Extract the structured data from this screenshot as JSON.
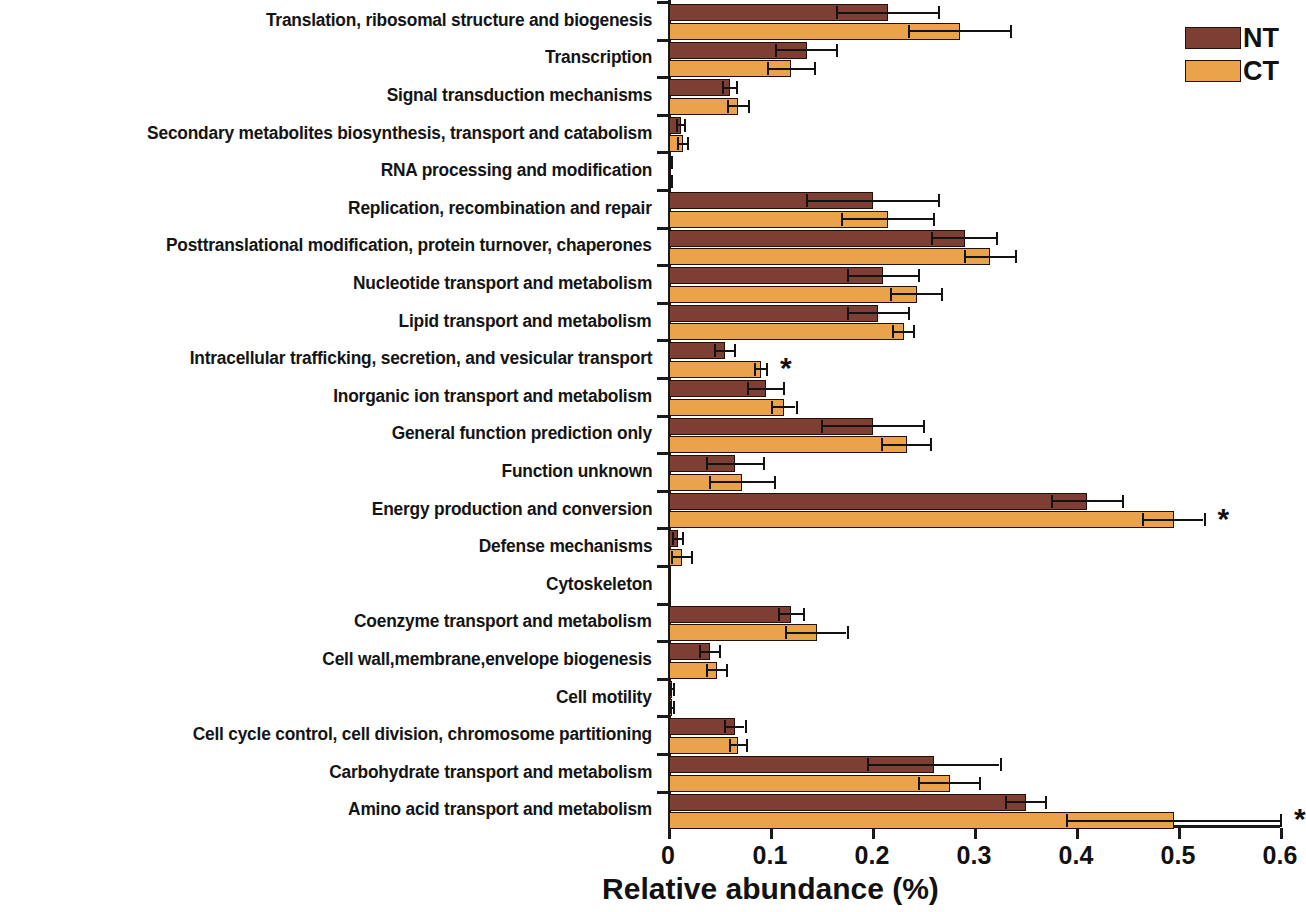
{
  "legend": {
    "entries": [
      {
        "key": "NT",
        "label": "NT",
        "color": "#7d3f33"
      },
      {
        "key": "CT",
        "label": "CT",
        "color": "#eaa24b"
      }
    ]
  },
  "axis": {
    "x_title": "Relative abundance (%)",
    "x_ticks": [
      "0",
      "0.1",
      "0.2",
      "0.3",
      "0.4",
      "0.5",
      "0.6"
    ],
    "significance_marker": "*"
  },
  "chart_data": {
    "type": "bar",
    "orientation": "horizontal",
    "title": "",
    "xlabel": "Relative abundance (%)",
    "ylabel": "",
    "xlim": [
      0,
      0.6
    ],
    "xticks": [
      0,
      0.1,
      0.2,
      0.3,
      0.4,
      0.5,
      0.6
    ],
    "grid": false,
    "legend_position": "top-right",
    "categories": [
      "Translation, ribosomal structure and biogenesis",
      "Transcription",
      "Signal transduction mechanisms",
      "Secondary metabolites biosynthesis, transport and catabolism",
      "RNA processing and modification",
      "Replication, recombination and repair",
      "Posttranslational modification, protein turnover, chaperones",
      "Nucleotide transport and metabolism",
      "Lipid transport and metabolism",
      "Intracellular trafficking, secretion, and vesicular transport",
      "Inorganic ion transport and metabolism",
      "General function prediction only",
      "Function unknown",
      "Energy production and conversion",
      "Defense mechanisms",
      "Cytoskeleton",
      "Coenzyme transport and metabolism",
      "Cell wall,membrane,envelope biogenesis",
      "Cell motility",
      "Cell cycle control, cell division, chromosome partitioning",
      "Carbohydrate transport and metabolism",
      "Amino acid transport and metabolism"
    ],
    "series": [
      {
        "name": "NT",
        "color": "#7d3f33",
        "values": [
          0.215,
          0.135,
          0.06,
          0.012,
          0.002,
          0.2,
          0.29,
          0.21,
          0.205,
          0.055,
          0.095,
          0.2,
          0.065,
          0.41,
          0.009,
          0.001,
          0.12,
          0.04,
          0.003,
          0.065,
          0.26,
          0.35
        ],
        "errors": [
          0.05,
          0.03,
          0.007,
          0.004,
          0.001,
          0.065,
          0.032,
          0.035,
          0.03,
          0.01,
          0.018,
          0.05,
          0.028,
          0.035,
          0.005,
          0.0,
          0.012,
          0.01,
          0.002,
          0.01,
          0.065,
          0.02
        ]
      },
      {
        "name": "CT",
        "color": "#eaa24b",
        "values": [
          0.285,
          0.12,
          0.068,
          0.014,
          0.002,
          0.215,
          0.315,
          0.243,
          0.23,
          0.09,
          0.113,
          0.233,
          0.072,
          0.495,
          0.013,
          0.001,
          0.145,
          0.047,
          0.003,
          0.068,
          0.275,
          0.495
        ],
        "errors": [
          0.05,
          0.023,
          0.01,
          0.005,
          0.001,
          0.045,
          0.025,
          0.025,
          0.01,
          0.006,
          0.012,
          0.024,
          0.032,
          0.03,
          0.01,
          0.0,
          0.03,
          0.01,
          0.002,
          0.008,
          0.03,
          0.105
        ]
      }
    ],
    "significance": {
      "marker": "*",
      "categories": [
        "Intracellular trafficking, secretion, and vesicular transport",
        "Energy production and conversion",
        "Amino acid transport and metabolism"
      ]
    }
  }
}
